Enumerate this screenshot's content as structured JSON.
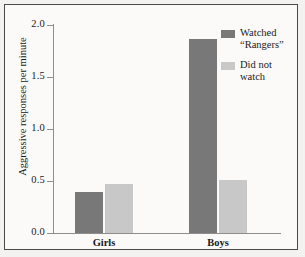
{
  "chart_data": {
    "type": "bar",
    "title": "",
    "xlabel": "",
    "ylabel": "Aggressive responses per minute",
    "categories": [
      "Girls",
      "Boys"
    ],
    "series": [
      {
        "name": "Watched \"Rangers\"",
        "legend_label": "Watched\n“Rangers”",
        "color": "#787878",
        "values": [
          0.39,
          1.87
        ]
      },
      {
        "name": "Did not watch",
        "legend_label": "Did not\nwatch",
        "color": "#c8c8c8",
        "values": [
          0.47,
          0.51
        ]
      }
    ],
    "ylim": [
      0.0,
      2.0
    ],
    "ytick_values": [
      0.0,
      0.5,
      1.0,
      1.5,
      2.0
    ],
    "ytick_labels": [
      "0.0",
      "0.5",
      "1.0",
      "1.5",
      "2.0"
    ],
    "grid": false,
    "legend_position": "top-right"
  },
  "figure": {
    "background_color": "#fbfaf8",
    "border_color": "#4a4a4a",
    "axis_color": "#8d8d8d"
  }
}
